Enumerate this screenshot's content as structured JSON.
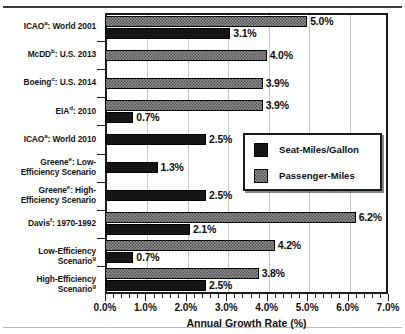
{
  "chart_data": {
    "type": "bar",
    "orientation": "horizontal",
    "title": "",
    "xlabel": "Annual Growth Rate (%)",
    "ylabel": "",
    "xlim": [
      0.0,
      7.0
    ],
    "xticks": [
      "0.0%",
      "1.0%",
      "2.0%",
      "3.0%",
      "4.0%",
      "5.0%",
      "6.0%",
      "7.0%"
    ],
    "xtick_values": [
      0.0,
      1.0,
      2.0,
      3.0,
      4.0,
      5.0,
      6.0,
      7.0
    ],
    "minor_ticks_per_interval": 5,
    "grid": true,
    "legend_position": "middle-right-inside",
    "categories": [
      "ICAO^a: World 2001",
      "McDD^b: U.S. 2013",
      "Boeing^c: U.S. 2014",
      "EIA^d: 2010",
      "ICAO^a: World 2010",
      "Greene^e: Low-Efficiency Scenario",
      "Greene^e: High-Efficiency Scenario",
      "Davis^f: 1970-1992",
      "Low-Efficiency Scenario^g",
      "High-Efficiency Scenario^g"
    ],
    "series": [
      {
        "name": "Seat-Miles/Gallon",
        "color": "#151515",
        "values": [
          3.1,
          null,
          null,
          0.7,
          2.5,
          1.3,
          2.5,
          2.1,
          0.7,
          2.5
        ],
        "labels": [
          "3.1%",
          "",
          "",
          "0.7%",
          "2.5%",
          "1.3%",
          "2.5%",
          "2.1%",
          "0.7%",
          "2.5%"
        ]
      },
      {
        "name": "Passenger-Miles",
        "color": "#8d8d8d",
        "values": [
          5.0,
          4.0,
          3.9,
          3.9,
          null,
          null,
          null,
          6.2,
          4.2,
          3.8
        ],
        "labels": [
          "5.0%",
          "4.0%",
          "3.9%",
          "3.9%",
          "",
          "",
          "",
          "6.2%",
          "4.2%",
          "3.8%"
        ]
      }
    ]
  },
  "categories_rich": [
    {
      "main": "ICAO",
      "sup": "a",
      "rest": ": World 2001",
      "lines": [
        "ICAO^a: World 2001"
      ]
    },
    {
      "main": "McDD",
      "sup": "b",
      "rest": ": U.S. 2013",
      "lines": [
        "McDD^b: U.S. 2013"
      ]
    },
    {
      "main": "Boeing",
      "sup": "c",
      "rest": ": U.S. 2014",
      "lines": [
        "Boeing^c: U.S. 2014"
      ]
    },
    {
      "main": "EIA",
      "sup": "d",
      "rest": ": 2010",
      "lines": [
        "EIA^d: 2010"
      ]
    },
    {
      "main": "ICAO",
      "sup": "a",
      "rest": ": World 2010",
      "lines": [
        "ICAO^a: World 2010"
      ]
    },
    {
      "main": "Greene",
      "sup": "e",
      "rest": ": Low-",
      "lines": [
        "Greene^e: Low-",
        "Efficiency Scenario"
      ]
    },
    {
      "main": "Greene",
      "sup": "e",
      "rest": ": High-",
      "lines": [
        "Greene^e: High-",
        "Efficiency Scenario"
      ]
    },
    {
      "main": "Davis",
      "sup": "f",
      "rest": ": 1970-1992",
      "lines": [
        "Davis^f: 1970-1992"
      ]
    },
    {
      "main": "Low-Efficiency Scenario",
      "sup": "g",
      "rest": "",
      "lines": [
        "Low-Efficiency Scenario^g"
      ]
    },
    {
      "main": "High-Efficiency Scenario",
      "sup": "g",
      "rest": "",
      "lines": [
        "High-Efficiency Scenario^g"
      ]
    }
  ],
  "axis": {
    "x_title": "Annual Growth Rate (%)",
    "x_tick_labels": [
      "0.0%",
      "1.0%",
      "2.0%",
      "3.0%",
      "4.0%",
      "5.0%",
      "6.0%",
      "7.0%"
    ]
  },
  "legend": {
    "items": [
      {
        "label": "Seat-Miles/Gallon",
        "swatch": "black-solid"
      },
      {
        "label": "Passenger-Miles",
        "swatch": "gray-dither"
      }
    ]
  },
  "colors": {
    "seat_miles_per_gallon": "#151515",
    "passenger_miles": "#8d8d8d",
    "axis": "#1a1a1a",
    "gridline": "#c8c8c8",
    "background": "#ffffff"
  }
}
